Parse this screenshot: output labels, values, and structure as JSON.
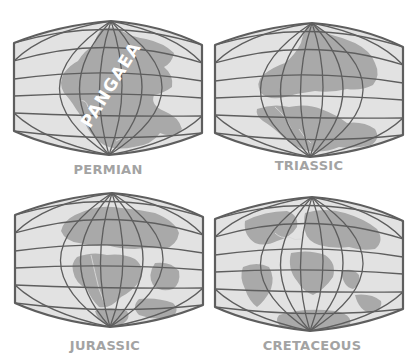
{
  "figure": {
    "panels": [
      {
        "id": "permian",
        "label": "PERMIAN",
        "annotation": "PANGAEA"
      },
      {
        "id": "triassic",
        "label": "TRIASSIC"
      },
      {
        "id": "jurassic",
        "label": "JURASSIC"
      },
      {
        "id": "cretaceous",
        "label": "CRETACEOUS"
      }
    ],
    "colors": {
      "background": "#ffffff",
      "ocean": "#e2e2e2",
      "land": "#a9a9a9",
      "grid": "#5e5e5e",
      "label": "#a3a3a3"
    }
  }
}
